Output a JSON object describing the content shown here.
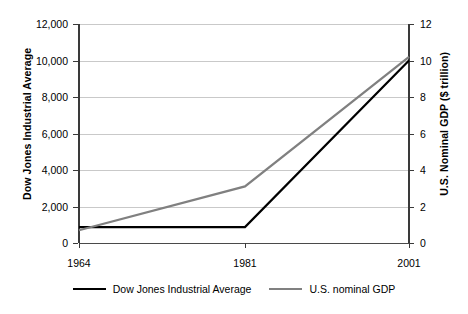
{
  "chart_data": {
    "type": "line",
    "title": "",
    "xlabel": "",
    "x": [
      1964,
      1981,
      2001
    ],
    "xtick_labels": [
      "1964",
      "1981",
      "2001"
    ],
    "xtick_positions_pct": [
      0,
      50.3,
      100
    ],
    "grid": true,
    "legend_position": "bottom",
    "axes": [
      {
        "side": "left",
        "label": "Dow Jones Industrial Average",
        "ylim": [
          0,
          12000
        ],
        "ytick_values": [
          0,
          2000,
          4000,
          6000,
          8000,
          10000,
          12000
        ],
        "ytick_labels": [
          "0",
          "2,000",
          "4,000",
          "6,000",
          "8,000",
          "10,000",
          "12,000"
        ]
      },
      {
        "side": "right",
        "label": "U.S. Nominal GDP ($ trillion)",
        "ylim": [
          0,
          12
        ],
        "ytick_values": [
          0,
          2,
          4,
          6,
          8,
          10,
          12
        ],
        "ytick_labels": [
          "0",
          "2",
          "4",
          "6",
          "8",
          "10",
          "12"
        ]
      }
    ],
    "series": [
      {
        "name": "Dow Jones Industrial Average",
        "axis": "left",
        "color": "#000000",
        "width": 2.2,
        "values": [
          875,
          875,
          10000
        ]
      },
      {
        "name": "U.S. nominal GDP",
        "axis": "right",
        "color": "#808080",
        "width": 2.2,
        "values": [
          0.7,
          3.1,
          10.2
        ]
      }
    ]
  },
  "axis_titles": {
    "left": "Dow Jones Industrial Average",
    "right": "U.S. Nominal GDP ($ trillion)"
  },
  "xticks": [
    {
      "label": "1964"
    },
    {
      "label": "1981"
    },
    {
      "label": "2001"
    }
  ],
  "yticks_left": [
    {
      "label": "12,000"
    },
    {
      "label": "10,000"
    },
    {
      "label": "8,000"
    },
    {
      "label": "6,000"
    },
    {
      "label": "4,000"
    },
    {
      "label": "2,000"
    },
    {
      "label": "0"
    }
  ],
  "yticks_right": [
    {
      "label": "12"
    },
    {
      "label": "10"
    },
    {
      "label": "8"
    },
    {
      "label": "6"
    },
    {
      "label": "4"
    },
    {
      "label": "2"
    },
    {
      "label": "0"
    }
  ],
  "legend": {
    "items": [
      {
        "label": "Dow Jones Industrial Average",
        "color": "#000000"
      },
      {
        "label": "U.S. nominal GDP",
        "color": "#808080"
      }
    ]
  },
  "colors": {
    "background": "#ffffff",
    "gridline": "#c9c9c9",
    "axis": "#3a3a3a",
    "baseline": "#4a4a4a",
    "dow_series": "#000000",
    "gdp_series": "#808080"
  }
}
